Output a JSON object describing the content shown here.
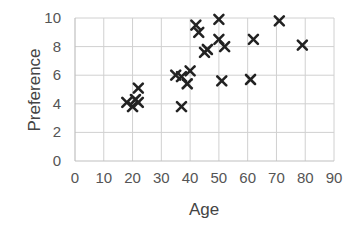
{
  "chart_data": {
    "type": "scatter",
    "title": "",
    "xlabel": "Age",
    "ylabel": "Preference",
    "xlim": [
      0,
      90
    ],
    "ylim": [
      0,
      10
    ],
    "xticks": [
      0,
      10,
      20,
      30,
      40,
      50,
      60,
      70,
      80,
      90
    ],
    "yticks": [
      0,
      2,
      4,
      6,
      8,
      10
    ],
    "grid": true,
    "legend": null,
    "marker": "x",
    "marker_color": "#222222",
    "points": [
      {
        "x": 18,
        "y": 4.1
      },
      {
        "x": 20,
        "y": 3.8
      },
      {
        "x": 21,
        "y": 4.3
      },
      {
        "x": 22,
        "y": 4.1
      },
      {
        "x": 22,
        "y": 5.1
      },
      {
        "x": 35,
        "y": 6.0
      },
      {
        "x": 37,
        "y": 5.9
      },
      {
        "x": 37,
        "y": 3.8
      },
      {
        "x": 39,
        "y": 5.4
      },
      {
        "x": 40,
        "y": 6.3
      },
      {
        "x": 42,
        "y": 9.5
      },
      {
        "x": 43,
        "y": 9.0
      },
      {
        "x": 45,
        "y": 7.6
      },
      {
        "x": 46,
        "y": 7.8
      },
      {
        "x": 50,
        "y": 9.9
      },
      {
        "x": 50,
        "y": 8.5
      },
      {
        "x": 51,
        "y": 5.6
      },
      {
        "x": 52,
        "y": 8.0
      },
      {
        "x": 61,
        "y": 5.7
      },
      {
        "x": 62,
        "y": 8.5
      },
      {
        "x": 71,
        "y": 9.8
      },
      {
        "x": 79,
        "y": 8.1
      }
    ]
  }
}
